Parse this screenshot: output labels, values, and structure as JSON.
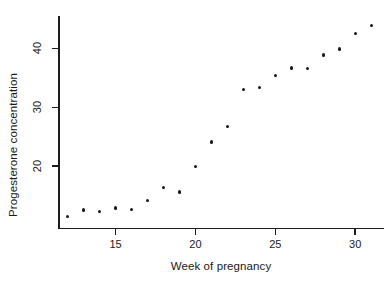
{
  "chart_data": {
    "type": "scatter",
    "title": "",
    "xlabel": "Week of pregnancy",
    "ylabel": "Progesterone concentration",
    "x": [
      12,
      13,
      14,
      15,
      16,
      17,
      18,
      19,
      20,
      21,
      22,
      23,
      24,
      25,
      26,
      27,
      28,
      29,
      30,
      31
    ],
    "y": [
      11.5,
      12.6,
      12.3,
      12.9,
      12.7,
      14.2,
      16.4,
      15.6,
      20.0,
      24.1,
      26.7,
      33.0,
      33.4,
      35.4,
      36.7,
      36.6,
      38.9,
      39.9,
      42.5,
      43.9
    ],
    "xlim": [
      11.4,
      31.8
    ],
    "ylim": [
      9.6,
      45.5
    ],
    "xticks": [
      15,
      20,
      25,
      30
    ],
    "yticks": [
      20,
      30,
      40
    ],
    "xtick_labels": [
      "15",
      "20",
      "25",
      "30"
    ],
    "ytick_labels": [
      "20",
      "30",
      "40"
    ],
    "grid": false,
    "legend": null,
    "marker": "filled-circle",
    "marker_color": "#1a1a1a"
  },
  "axes": {
    "x_title": "Week of pregnancy",
    "y_title": "Progesterone concentration"
  }
}
